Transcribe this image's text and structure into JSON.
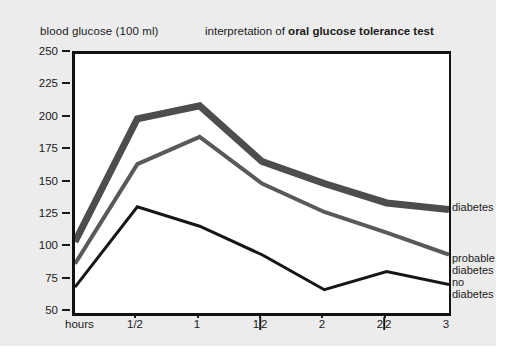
{
  "titles": {
    "y_axis_label": "blood glucose (100 ml)",
    "chart_title_prefix": "interpretation of ",
    "chart_title_emphasis": "oral glucose tolerance test",
    "x_axis_name": "hours"
  },
  "axes": {
    "y_ticks": [
      "250",
      "225",
      "200",
      "175",
      "150",
      "125",
      "100",
      "75",
      "50"
    ],
    "x_ticks": [
      "1/2",
      "1",
      "1|2",
      "2",
      "2|2",
      "3"
    ]
  },
  "series_labels": {
    "diabetes": "diabetes",
    "probable_line1": "probable",
    "probable_line2": "diabetes",
    "no_line1": "no",
    "no_line2": "diabetes"
  },
  "colors": {
    "figure_background": "#ececec",
    "plot_background": "#ffffff",
    "frame": "#121212",
    "diabetes_line": "#4d4d4d",
    "probable_line": "#595959",
    "no_diabetes_line": "#161616",
    "text": "#1b1b1b"
  },
  "chart_data": {
    "type": "line",
    "title": "interpretation of oral glucose tolerance test",
    "xlabel": "hours",
    "ylabel": "blood glucose (100 ml)",
    "xlim": [
      0,
      3
    ],
    "ylim": [
      50,
      250
    ],
    "grid": false,
    "legend_position": "right-inline",
    "x": [
      0,
      0.5,
      1,
      1.5,
      2,
      2.5,
      3
    ],
    "x_tick_labels": [
      "1/2",
      "1",
      "1½",
      "2",
      "2½",
      "3"
    ],
    "y_tick_values": [
      50,
      75,
      100,
      125,
      150,
      175,
      200,
      225,
      250
    ],
    "series": [
      {
        "name": "diabetes",
        "color": "#4d4d4d",
        "line_width": 7,
        "values": [
          105,
          200,
          210,
          167,
          150,
          135,
          130
        ]
      },
      {
        "name": "probable diabetes",
        "color": "#595959",
        "line_width": 4,
        "values": [
          88,
          165,
          186,
          150,
          128,
          112,
          95
        ]
      },
      {
        "name": "no diabetes",
        "color": "#161616",
        "line_width": 3,
        "values": [
          70,
          132,
          117,
          95,
          68,
          82,
          72
        ]
      }
    ]
  }
}
